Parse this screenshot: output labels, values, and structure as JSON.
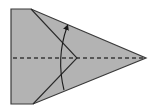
{
  "diagram": {
    "type": "origami-fold-instruction",
    "colors": {
      "background": "#ffffff",
      "paper_fill": "#b3b3b3",
      "outline": "#3a3a3a",
      "dashed_line": "#3a3a3a",
      "fold_line": "#2a2a2a",
      "arrow": "#1a1a1a"
    },
    "shapes": {
      "paper": "11,9 31,9 146,58 33,104 11,104",
      "center_valley_fold": {
        "x1": 13,
        "y1": 58,
        "x2": 146,
        "y2": 58
      },
      "fold_edge": "31,9 77,58 33,104",
      "arrow_path": "M 64 90 Q 56 58 67 27"
    },
    "elements": [
      "paper-shape",
      "center-valley-fold-line",
      "folded-flap-edge",
      "fold-direction-arrow"
    ]
  }
}
